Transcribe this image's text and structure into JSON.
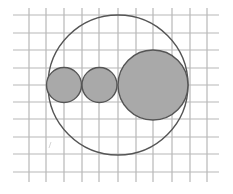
{
  "diagram": {
    "type": "geometry-figure",
    "colors": {
      "background": "#ffffff",
      "grid": "#b8b8b8",
      "stroke": "#555555",
      "fill": "#a9a9a9"
    },
    "grid": {
      "x_lines": [
        29,
        46,
        64,
        82,
        99,
        118,
        136,
        153,
        172,
        190,
        207
      ],
      "y_lines": [
        15,
        33,
        50,
        68,
        85,
        102,
        119,
        137,
        154,
        172
      ],
      "x_extent": [
        13,
        219
      ],
      "y_extent": [
        8,
        182
      ]
    },
    "outer_circle": {
      "cx": 118,
      "cy": 85,
      "r": 70
    },
    "filled_circles": [
      {
        "name": "small-circle-1",
        "cx": 64,
        "cy": 85,
        "r": 17.5
      },
      {
        "name": "small-circle-2",
        "cx": 99.5,
        "cy": 85,
        "r": 17.5
      },
      {
        "name": "large-circle",
        "cx": 153,
        "cy": 85,
        "r": 35
      }
    ],
    "stray_mark": {
      "x1": 49,
      "y1": 148,
      "x2": 51,
      "y2": 142
    }
  }
}
